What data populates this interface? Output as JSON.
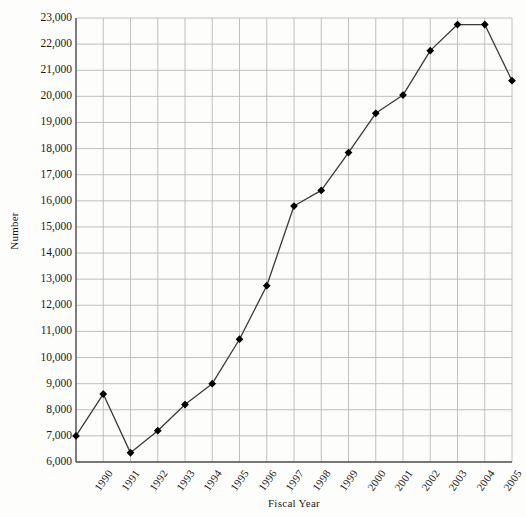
{
  "chart_data": {
    "type": "line",
    "title": "",
    "xlabel": "Fiscal Year",
    "ylabel": "Number",
    "categories": [
      "1990",
      "1991",
      "1992",
      "1993",
      "1994",
      "1995",
      "1996",
      "1997",
      "1998",
      "1999",
      "2000",
      "2001",
      "2002",
      "2003",
      "2004",
      "2005",
      "2006"
    ],
    "values": [
      7000,
      8600,
      6350,
      7200,
      8200,
      9000,
      10700,
      12750,
      15800,
      16400,
      17850,
      19350,
      20050,
      21750,
      22750,
      22750,
      20600
    ],
    "ylim": [
      6000,
      23000
    ],
    "ytick_values": [
      6000,
      7000,
      8000,
      9000,
      10000,
      11000,
      12000,
      13000,
      14000,
      15000,
      16000,
      17000,
      18000,
      19000,
      20000,
      21000,
      22000,
      23000
    ],
    "ytick_labels": [
      "6,000",
      "7,000",
      "8,000",
      "9,000",
      "10,000",
      "11,000",
      "12,000",
      "13,000",
      "14,000",
      "15,000",
      "16,000",
      "17,000",
      "18,000",
      "19,000",
      "20,000",
      "21,000",
      "22,000",
      "23,000"
    ],
    "grid": true,
    "legend": "none",
    "marker": "filled-diamond",
    "line_color": "#3a3a3a",
    "marker_color": "#000000",
    "grid_color": "#b9b9b9",
    "axis_color": "#555555",
    "background_color": "#fdfdfc"
  }
}
